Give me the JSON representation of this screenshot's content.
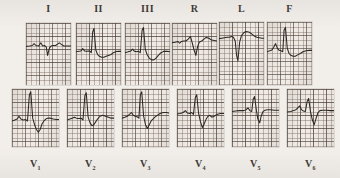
{
  "document": {
    "kind": "12-lead electrocardiogram recording",
    "paper": {
      "background_hex": "#f2efeb",
      "panel_hex": "#efeae4",
      "fine_grid_hex": "#786460",
      "bold_grid_hex": "#463a36",
      "trace_hex": "#2b2723"
    }
  },
  "rows": {
    "limb": {
      "name": "limb-and-augmented-leads",
      "labels_position": "above",
      "leads": [
        {
          "id": "I",
          "label": "I",
          "sub": "",
          "x": 26,
          "y": 23,
          "w": 45,
          "h": 62
        },
        {
          "id": "II",
          "label": "II",
          "sub": "",
          "x": 76,
          "y": 23,
          "w": 45,
          "h": 62
        },
        {
          "id": "III",
          "label": "III",
          "sub": "",
          "x": 125,
          "y": 23,
          "w": 45,
          "h": 62
        },
        {
          "id": "R",
          "label": "R",
          "sub": "",
          "x": 172,
          "y": 23,
          "w": 45,
          "h": 62
        },
        {
          "id": "L",
          "label": "L",
          "sub": "",
          "x": 219,
          "y": 22,
          "w": 45,
          "h": 63
        },
        {
          "id": "F",
          "label": "F",
          "sub": "",
          "x": 267,
          "y": 22,
          "w": 45,
          "h": 63
        }
      ]
    },
    "precordial": {
      "name": "precordial-chest-leads",
      "labels_position": "below",
      "leads": [
        {
          "id": "V1",
          "label": "V",
          "sub": "1",
          "x": 12,
          "y": 89,
          "w": 47,
          "h": 58
        },
        {
          "id": "V2",
          "label": "V",
          "sub": "2",
          "x": 67,
          "y": 89,
          "w": 47,
          "h": 58
        },
        {
          "id": "V3",
          "label": "V",
          "sub": "3",
          "x": 122,
          "y": 89,
          "w": 47,
          "h": 58
        },
        {
          "id": "V4",
          "label": "V",
          "sub": "4",
          "x": 177,
          "y": 89,
          "w": 47,
          "h": 58
        },
        {
          "id": "V5",
          "label": "V",
          "sub": "5",
          "x": 232,
          "y": 89,
          "w": 47,
          "h": 58
        },
        {
          "id": "V6",
          "label": "V",
          "sub": "6",
          "x": 287,
          "y": 89,
          "w": 47,
          "h": 58
        }
      ]
    }
  },
  "chart_data": {
    "type": "line",
    "title": "",
    "xlabel": "",
    "ylabel": "",
    "grid": true,
    "legend": "none",
    "x_unit": "normalized panel width (0-100)",
    "y_unit": "normalized panel height (0-100, 0 = top)",
    "series": [
      {
        "name": "I",
        "baseline_y": 50,
        "points": [
          [
            0,
            52
          ],
          [
            8,
            51
          ],
          [
            14,
            50
          ],
          [
            18,
            46
          ],
          [
            22,
            50
          ],
          [
            28,
            51
          ],
          [
            33,
            44
          ],
          [
            37,
            51
          ],
          [
            41,
            50
          ],
          [
            45,
            53
          ],
          [
            48,
            72
          ],
          [
            52,
            56
          ],
          [
            56,
            51
          ],
          [
            60,
            50
          ],
          [
            66,
            50
          ],
          [
            70,
            47
          ],
          [
            74,
            44
          ],
          [
            78,
            47
          ],
          [
            84,
            51
          ],
          [
            92,
            51
          ],
          [
            100,
            51
          ]
        ]
      },
      {
        "name": "II",
        "baseline_y": 62,
        "points": [
          [
            0,
            64
          ],
          [
            6,
            63
          ],
          [
            11,
            62
          ],
          [
            15,
            57
          ],
          [
            19,
            62
          ],
          [
            24,
            63
          ],
          [
            30,
            62
          ],
          [
            34,
            66
          ],
          [
            37,
            20
          ],
          [
            40,
            12
          ],
          [
            44,
            60
          ],
          [
            48,
            70
          ],
          [
            52,
            74
          ],
          [
            57,
            76
          ],
          [
            62,
            76
          ],
          [
            67,
            74
          ],
          [
            72,
            72
          ],
          [
            78,
            70
          ],
          [
            83,
            66
          ],
          [
            88,
            64
          ],
          [
            94,
            63
          ],
          [
            100,
            63
          ]
        ]
      },
      {
        "name": "III",
        "baseline_y": 62,
        "points": [
          [
            0,
            66
          ],
          [
            7,
            64
          ],
          [
            13,
            62
          ],
          [
            17,
            58
          ],
          [
            21,
            63
          ],
          [
            26,
            64
          ],
          [
            30,
            63
          ],
          [
            34,
            66
          ],
          [
            38,
            16
          ],
          [
            41,
            10
          ],
          [
            45,
            58
          ],
          [
            49,
            70
          ],
          [
            54,
            78
          ],
          [
            59,
            82
          ],
          [
            64,
            82
          ],
          [
            69,
            78
          ],
          [
            74,
            72
          ],
          [
            80,
            66
          ],
          [
            86,
            63
          ],
          [
            93,
            63
          ],
          [
            100,
            64
          ]
        ]
      },
      {
        "name": "R",
        "baseline_y": 40,
        "points": [
          [
            0,
            44
          ],
          [
            7,
            43
          ],
          [
            13,
            41
          ],
          [
            17,
            45
          ],
          [
            21,
            41
          ],
          [
            26,
            40
          ],
          [
            31,
            40
          ],
          [
            36,
            36
          ],
          [
            41,
            30
          ],
          [
            45,
            44
          ],
          [
            49,
            60
          ],
          [
            53,
            72
          ],
          [
            57,
            52
          ],
          [
            61,
            42
          ],
          [
            66,
            40
          ],
          [
            71,
            36
          ],
          [
            76,
            32
          ],
          [
            82,
            34
          ],
          [
            88,
            38
          ],
          [
            94,
            39
          ],
          [
            100,
            40
          ]
        ]
      },
      {
        "name": "L",
        "baseline_y": 34,
        "points": [
          [
            0,
            37
          ],
          [
            6,
            36
          ],
          [
            12,
            35
          ],
          [
            18,
            34
          ],
          [
            23,
            34
          ],
          [
            28,
            32
          ],
          [
            32,
            34
          ],
          [
            36,
            42
          ],
          [
            39,
            74
          ],
          [
            42,
            86
          ],
          [
            46,
            44
          ],
          [
            50,
            30
          ],
          [
            55,
            24
          ],
          [
            60,
            21
          ],
          [
            66,
            22
          ],
          [
            72,
            26
          ],
          [
            78,
            31
          ],
          [
            84,
            34
          ],
          [
            90,
            35
          ],
          [
            95,
            36
          ],
          [
            100,
            36
          ]
        ]
      },
      {
        "name": "F",
        "baseline_y": 62,
        "points": [
          [
            0,
            66
          ],
          [
            6,
            64
          ],
          [
            11,
            62
          ],
          [
            15,
            56
          ],
          [
            19,
            48
          ],
          [
            23,
            58
          ],
          [
            27,
            63
          ],
          [
            31,
            64
          ],
          [
            35,
            66
          ],
          [
            38,
            18
          ],
          [
            41,
            12
          ],
          [
            45,
            58
          ],
          [
            49,
            70
          ],
          [
            53,
            74
          ],
          [
            58,
            76
          ],
          [
            63,
            76
          ],
          [
            68,
            73
          ],
          [
            74,
            70
          ],
          [
            80,
            66
          ],
          [
            87,
            64
          ],
          [
            94,
            63
          ],
          [
            100,
            63
          ]
        ]
      },
      {
        "name": "V1",
        "baseline_y": 64,
        "points": [
          [
            0,
            68
          ],
          [
            6,
            66
          ],
          [
            11,
            64
          ],
          [
            15,
            58
          ],
          [
            19,
            64
          ],
          [
            24,
            66
          ],
          [
            29,
            65
          ],
          [
            33,
            68
          ],
          [
            37,
            12
          ],
          [
            40,
            6
          ],
          [
            44,
            62
          ],
          [
            48,
            76
          ],
          [
            52,
            86
          ],
          [
            56,
            92
          ],
          [
            60,
            86
          ],
          [
            64,
            74
          ],
          [
            68,
            68
          ],
          [
            72,
            64
          ],
          [
            76,
            62
          ],
          [
            82,
            62
          ],
          [
            88,
            64
          ],
          [
            94,
            65
          ],
          [
            100,
            65
          ]
        ]
      },
      {
        "name": "V2",
        "baseline_y": 62,
        "points": [
          [
            0,
            66
          ],
          [
            6,
            64
          ],
          [
            11,
            62
          ],
          [
            16,
            60
          ],
          [
            20,
            62
          ],
          [
            25,
            63
          ],
          [
            30,
            62
          ],
          [
            34,
            66
          ],
          [
            38,
            14
          ],
          [
            41,
            8
          ],
          [
            45,
            60
          ],
          [
            49,
            72
          ],
          [
            53,
            78
          ],
          [
            57,
            76
          ],
          [
            61,
            70
          ],
          [
            65,
            64
          ],
          [
            70,
            58
          ],
          [
            76,
            56
          ],
          [
            82,
            58
          ],
          [
            88,
            60
          ],
          [
            94,
            62
          ],
          [
            100,
            62
          ]
        ]
      },
      {
        "name": "V3",
        "baseline_y": 58,
        "points": [
          [
            0,
            62
          ],
          [
            6,
            60
          ],
          [
            11,
            58
          ],
          [
            16,
            54
          ],
          [
            20,
            50
          ],
          [
            24,
            56
          ],
          [
            28,
            58
          ],
          [
            32,
            59
          ],
          [
            36,
            62
          ],
          [
            39,
            12
          ],
          [
            42,
            6
          ],
          [
            46,
            58
          ],
          [
            50,
            76
          ],
          [
            54,
            84
          ],
          [
            58,
            76
          ],
          [
            62,
            68
          ],
          [
            66,
            64
          ],
          [
            70,
            60
          ],
          [
            75,
            56
          ],
          [
            81,
            52
          ],
          [
            88,
            50
          ],
          [
            94,
            50
          ],
          [
            100,
            51
          ]
        ]
      },
      {
        "name": "V4",
        "baseline_y": 50,
        "points": [
          [
            0,
            53
          ],
          [
            7,
            52
          ],
          [
            13,
            50
          ],
          [
            18,
            46
          ],
          [
            22,
            51
          ],
          [
            27,
            52
          ],
          [
            31,
            50
          ],
          [
            35,
            54
          ],
          [
            39,
            18
          ],
          [
            42,
            12
          ],
          [
            46,
            52
          ],
          [
            50,
            70
          ],
          [
            54,
            82
          ],
          [
            58,
            74
          ],
          [
            62,
            64
          ],
          [
            66,
            58
          ],
          [
            70,
            56
          ],
          [
            74,
            60
          ],
          [
            79,
            58
          ],
          [
            85,
            54
          ],
          [
            92,
            52
          ],
          [
            100,
            52
          ]
        ]
      },
      {
        "name": "V5",
        "baseline_y": 46,
        "points": [
          [
            0,
            48
          ],
          [
            8,
            47
          ],
          [
            15,
            46
          ],
          [
            20,
            46
          ],
          [
            25,
            46
          ],
          [
            30,
            44
          ],
          [
            34,
            40
          ],
          [
            38,
            46
          ],
          [
            42,
            48
          ],
          [
            45,
            22
          ],
          [
            48,
            16
          ],
          [
            52,
            46
          ],
          [
            55,
            64
          ],
          [
            59,
            72
          ],
          [
            62,
            58
          ],
          [
            66,
            48
          ],
          [
            70,
            45
          ],
          [
            76,
            44
          ],
          [
            82,
            44
          ],
          [
            90,
            45
          ],
          [
            100,
            45
          ]
        ]
      },
      {
        "name": "V6",
        "baseline_y": 46,
        "points": [
          [
            0,
            49
          ],
          [
            8,
            48
          ],
          [
            14,
            46
          ],
          [
            19,
            44
          ],
          [
            23,
            40
          ],
          [
            27,
            36
          ],
          [
            31,
            44
          ],
          [
            35,
            47
          ],
          [
            39,
            48
          ],
          [
            43,
            26
          ],
          [
            46,
            20
          ],
          [
            50,
            48
          ],
          [
            54,
            66
          ],
          [
            58,
            76
          ],
          [
            62,
            62
          ],
          [
            66,
            50
          ],
          [
            70,
            46
          ],
          [
            76,
            45
          ],
          [
            84,
            45
          ],
          [
            92,
            46
          ],
          [
            100,
            46
          ]
        ]
      }
    ]
  }
}
